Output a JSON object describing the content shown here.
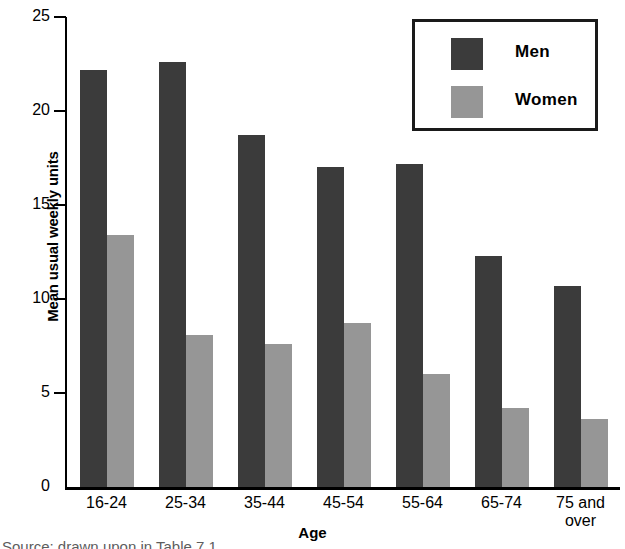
{
  "chart_data": {
    "type": "bar",
    "title": "",
    "xlabel": "Age",
    "ylabel": "Mean usual weekly units",
    "categories": [
      "16-24",
      "25-34",
      "35-44",
      "45-54",
      "55-64",
      "65-74",
      "75 and over"
    ],
    "series": [
      {
        "name": "Men",
        "color": "#3b3b3b",
        "values": [
          22.2,
          22.6,
          18.7,
          17.0,
          17.2,
          12.3,
          10.7
        ]
      },
      {
        "name": "Women",
        "color": "#969696",
        "values": [
          13.4,
          8.1,
          7.6,
          8.7,
          6.0,
          4.2,
          3.6
        ]
      }
    ],
    "ylim": [
      0,
      25
    ],
    "yticks": [
      0,
      5,
      10,
      15,
      20,
      25
    ],
    "ytick_labels": [
      "0",
      "5",
      "10",
      "15",
      "20",
      "25"
    ],
    "grid": false,
    "legend_position": "top-right"
  },
  "legend": {
    "items": [
      {
        "label": "Men"
      },
      {
        "label": "Women"
      }
    ]
  },
  "footer": {
    "caption": "Source: drawn upon in Table 7.1"
  }
}
